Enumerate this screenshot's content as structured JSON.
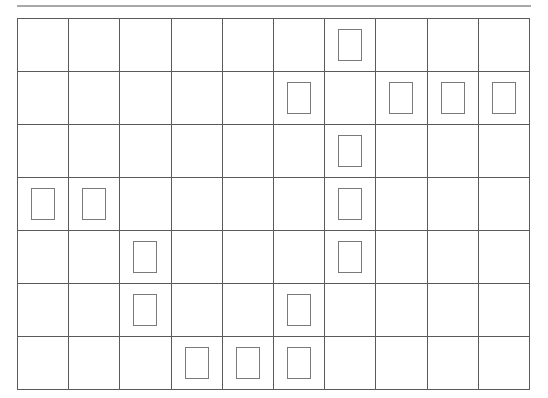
{
  "grid": {
    "columns": 10,
    "rows": 7,
    "line_color": "#5a5a5a",
    "marker_color": "#7a7a7a",
    "markers": [
      {
        "row": 0,
        "col": 6
      },
      {
        "row": 1,
        "col": 5
      },
      {
        "row": 1,
        "col": 7
      },
      {
        "row": 1,
        "col": 8
      },
      {
        "row": 1,
        "col": 9
      },
      {
        "row": 2,
        "col": 6
      },
      {
        "row": 3,
        "col": 0
      },
      {
        "row": 3,
        "col": 1
      },
      {
        "row": 3,
        "col": 6
      },
      {
        "row": 4,
        "col": 2
      },
      {
        "row": 4,
        "col": 6
      },
      {
        "row": 5,
        "col": 2
      },
      {
        "row": 5,
        "col": 5
      },
      {
        "row": 6,
        "col": 3
      },
      {
        "row": 6,
        "col": 4
      },
      {
        "row": 6,
        "col": 5
      }
    ]
  }
}
